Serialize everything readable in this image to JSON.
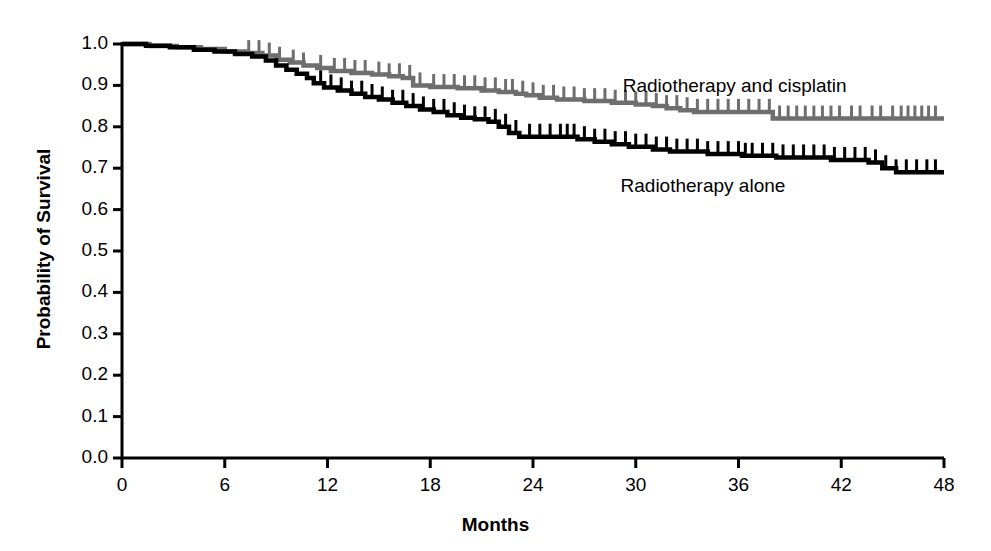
{
  "chart_data": {
    "type": "line",
    "subtype": "kaplan-meier-survival",
    "title": "",
    "xlabel": "Months",
    "ylabel": "Probability of Survival",
    "xlim": [
      0,
      48
    ],
    "ylim": [
      0.0,
      1.0
    ],
    "xticks": [
      0,
      6,
      12,
      18,
      24,
      30,
      36,
      42,
      48
    ],
    "xtick_labels": [
      "0",
      "6",
      "12",
      "18",
      "24",
      "30",
      "36",
      "42",
      "48"
    ],
    "yticks": [
      0.0,
      0.1,
      0.2,
      0.3,
      0.4,
      0.5,
      0.6,
      0.7,
      0.8,
      0.9,
      1.0
    ],
    "ytick_labels": [
      "0.0",
      "0.1",
      "0.2",
      "0.3",
      "0.4",
      "0.5",
      "0.6",
      "0.7",
      "0.8",
      "0.9",
      "1.0"
    ],
    "grid": false,
    "legend_position": "inline-annotation",
    "series": [
      {
        "name": "Radiotherapy and cisplatin",
        "color": "#6e6e6e",
        "label_x": 36.3,
        "label_y": 0.895,
        "final_value": 0.82,
        "steps": [
          [
            0.0,
            1.0
          ],
          [
            1.6,
            1.0
          ],
          [
            1.6,
            0.995
          ],
          [
            3.2,
            0.995
          ],
          [
            3.2,
            0.992
          ],
          [
            4.6,
            0.992
          ],
          [
            4.6,
            0.988
          ],
          [
            6.0,
            0.988
          ],
          [
            6.0,
            0.982
          ],
          [
            7.2,
            0.982
          ],
          [
            7.2,
            0.978
          ],
          [
            8.2,
            0.978
          ],
          [
            8.2,
            0.972
          ],
          [
            9.0,
            0.972
          ],
          [
            9.0,
            0.962
          ],
          [
            9.8,
            0.962
          ],
          [
            9.8,
            0.955
          ],
          [
            10.6,
            0.955
          ],
          [
            10.6,
            0.948
          ],
          [
            11.4,
            0.948
          ],
          [
            11.4,
            0.942
          ],
          [
            12.2,
            0.942
          ],
          [
            12.2,
            0.935
          ],
          [
            13.4,
            0.935
          ],
          [
            13.4,
            0.93
          ],
          [
            14.6,
            0.93
          ],
          [
            14.6,
            0.926
          ],
          [
            15.6,
            0.926
          ],
          [
            15.6,
            0.922
          ],
          [
            16.4,
            0.922
          ],
          [
            16.4,
            0.918
          ],
          [
            17.0,
            0.918
          ],
          [
            17.0,
            0.9
          ],
          [
            18.0,
            0.9
          ],
          [
            18.0,
            0.896
          ],
          [
            19.6,
            0.896
          ],
          [
            19.6,
            0.893
          ],
          [
            21.0,
            0.893
          ],
          [
            21.0,
            0.888
          ],
          [
            22.0,
            0.888
          ],
          [
            22.0,
            0.884
          ],
          [
            23.0,
            0.884
          ],
          [
            23.0,
            0.88
          ],
          [
            23.6,
            0.88
          ],
          [
            23.6,
            0.876
          ],
          [
            24.4,
            0.876
          ],
          [
            24.4,
            0.87
          ],
          [
            25.4,
            0.87
          ],
          [
            25.4,
            0.866
          ],
          [
            27.0,
            0.866
          ],
          [
            27.0,
            0.862
          ],
          [
            28.6,
            0.862
          ],
          [
            28.6,
            0.858
          ],
          [
            30.0,
            0.858
          ],
          [
            30.0,
            0.854
          ],
          [
            31.0,
            0.854
          ],
          [
            31.0,
            0.85
          ],
          [
            31.8,
            0.85
          ],
          [
            31.8,
            0.845
          ],
          [
            32.6,
            0.845
          ],
          [
            32.6,
            0.84
          ],
          [
            33.4,
            0.84
          ],
          [
            33.4,
            0.836
          ],
          [
            38.0,
            0.836
          ],
          [
            38.0,
            0.82
          ],
          [
            48.0,
            0.82
          ]
        ],
        "censor_marks": [
          7.4,
          8.0,
          8.6,
          9.2,
          10.0,
          10.6,
          11.6,
          12.4,
          13.0,
          13.6,
          14.2,
          15.0,
          15.6,
          16.2,
          16.8,
          17.4,
          18.2,
          18.8,
          19.4,
          20.0,
          20.6,
          21.2,
          21.8,
          22.4,
          22.8,
          23.4,
          24.0,
          24.6,
          25.2,
          25.8,
          26.4,
          27.0,
          27.6,
          28.2,
          28.8,
          29.4,
          30.0,
          30.6,
          31.2,
          31.8,
          32.4,
          33.0,
          33.6,
          34.2,
          34.8,
          35.4,
          36.0,
          36.6,
          37.2,
          37.8,
          38.4,
          38.9,
          39.4,
          39.9,
          40.4,
          40.9,
          41.4,
          41.9,
          42.6,
          43.1,
          43.8,
          44.3,
          45.0,
          45.5,
          45.9,
          46.3,
          46.7,
          47.1,
          47.5
        ]
      },
      {
        "name": "Radiotherapy alone",
        "color": "#000000",
        "label_x": 34.0,
        "label_y": 0.655,
        "final_value": 0.69,
        "steps": [
          [
            0.0,
            1.0
          ],
          [
            1.4,
            1.0
          ],
          [
            1.4,
            0.996
          ],
          [
            2.8,
            0.996
          ],
          [
            2.8,
            0.992
          ],
          [
            4.2,
            0.992
          ],
          [
            4.2,
            0.986
          ],
          [
            5.4,
            0.986
          ],
          [
            5.4,
            0.982
          ],
          [
            6.6,
            0.982
          ],
          [
            6.6,
            0.976
          ],
          [
            7.6,
            0.976
          ],
          [
            7.6,
            0.97
          ],
          [
            8.4,
            0.97
          ],
          [
            8.4,
            0.96
          ],
          [
            9.0,
            0.96
          ],
          [
            9.0,
            0.948
          ],
          [
            9.6,
            0.948
          ],
          [
            9.6,
            0.938
          ],
          [
            10.2,
            0.938
          ],
          [
            10.2,
            0.928
          ],
          [
            10.8,
            0.928
          ],
          [
            10.8,
            0.918
          ],
          [
            11.2,
            0.918
          ],
          [
            11.2,
            0.905
          ],
          [
            11.8,
            0.905
          ],
          [
            11.8,
            0.895
          ],
          [
            12.6,
            0.895
          ],
          [
            12.6,
            0.888
          ],
          [
            13.4,
            0.888
          ],
          [
            13.4,
            0.88
          ],
          [
            14.2,
            0.88
          ],
          [
            14.2,
            0.872
          ],
          [
            15.0,
            0.872
          ],
          [
            15.0,
            0.866
          ],
          [
            15.8,
            0.866
          ],
          [
            15.8,
            0.858
          ],
          [
            16.6,
            0.858
          ],
          [
            16.6,
            0.85
          ],
          [
            17.4,
            0.85
          ],
          [
            17.4,
            0.842
          ],
          [
            18.2,
            0.842
          ],
          [
            18.2,
            0.836
          ],
          [
            19.0,
            0.836
          ],
          [
            19.0,
            0.828
          ],
          [
            19.8,
            0.828
          ],
          [
            19.8,
            0.822
          ],
          [
            20.6,
            0.822
          ],
          [
            20.6,
            0.818
          ],
          [
            21.4,
            0.818
          ],
          [
            21.4,
            0.812
          ],
          [
            22.0,
            0.812
          ],
          [
            22.0,
            0.8
          ],
          [
            22.6,
            0.8
          ],
          [
            22.6,
            0.785
          ],
          [
            23.2,
            0.785
          ],
          [
            23.2,
            0.776
          ],
          [
            26.6,
            0.776
          ],
          [
            26.6,
            0.77
          ],
          [
            27.6,
            0.77
          ],
          [
            27.6,
            0.764
          ],
          [
            28.6,
            0.764
          ],
          [
            28.6,
            0.758
          ],
          [
            29.6,
            0.758
          ],
          [
            29.6,
            0.752
          ],
          [
            31.0,
            0.752
          ],
          [
            31.0,
            0.745
          ],
          [
            32.0,
            0.745
          ],
          [
            32.0,
            0.74
          ],
          [
            34.2,
            0.74
          ],
          [
            34.2,
            0.734
          ],
          [
            36.2,
            0.734
          ],
          [
            36.2,
            0.73
          ],
          [
            38.2,
            0.73
          ],
          [
            38.2,
            0.726
          ],
          [
            41.4,
            0.726
          ],
          [
            41.4,
            0.72
          ],
          [
            43.6,
            0.72
          ],
          [
            43.6,
            0.714
          ],
          [
            44.4,
            0.714
          ],
          [
            44.4,
            0.7
          ],
          [
            45.2,
            0.7
          ],
          [
            45.2,
            0.69
          ],
          [
            48.0,
            0.69
          ]
        ],
        "censor_marks": [
          11.6,
          12.2,
          12.8,
          13.4,
          14.0,
          14.6,
          15.2,
          15.8,
          16.4,
          17.0,
          17.6,
          18.2,
          18.8,
          19.4,
          20.0,
          20.6,
          21.2,
          21.8,
          22.4,
          23.0,
          23.8,
          24.4,
          25.0,
          25.6,
          26.0,
          26.4,
          27.0,
          27.6,
          28.2,
          28.8,
          29.4,
          30.0,
          30.6,
          31.2,
          31.8,
          32.4,
          33.0,
          33.6,
          34.2,
          34.8,
          35.4,
          36.0,
          36.4,
          36.8,
          37.4,
          38.0,
          38.6,
          39.2,
          39.8,
          40.4,
          41.0,
          41.6,
          42.2,
          42.8,
          43.4,
          44.0,
          44.6,
          45.2,
          45.8,
          46.4,
          47.0,
          47.5
        ]
      }
    ]
  },
  "axes": {
    "ylabel": "Probability of Survival",
    "xlabel": "Months"
  }
}
